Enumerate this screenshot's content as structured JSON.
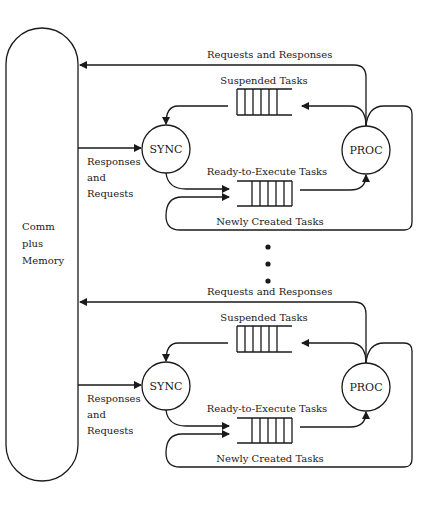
{
  "diagram": {
    "memory_block": {
      "label_lines": [
        "Comm",
        "plus",
        "Memory"
      ]
    },
    "processors": [
      {
        "sync_label": "SYNC",
        "proc_label": "PROC",
        "edge_top": "Requests and Responses",
        "edge_in_lines": [
          "Responses",
          "and",
          "Requests"
        ],
        "suspended_queue": "Suspended Tasks",
        "ready_queue": "Ready-to-Execute Tasks",
        "new_tasks": "Newly Created Tasks"
      },
      {
        "sync_label": "SYNC",
        "proc_label": "PROC",
        "edge_top": "Requests and Responses",
        "edge_in_lines": [
          "Responses",
          "and",
          "Requests"
        ],
        "suspended_queue": "Suspended Tasks",
        "ready_queue": "Ready-to-Execute Tasks",
        "new_tasks": "Newly Created Tasks"
      }
    ],
    "ellipsis": "vertical-dots"
  }
}
